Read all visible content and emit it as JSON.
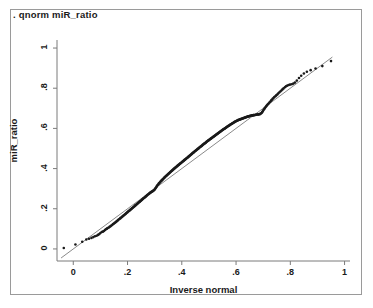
{
  "window": {
    "title": "qnorm miR_ratio plot",
    "background_color": "#ffffff",
    "frame_color": "#9a9a9a"
  },
  "command": {
    "text": ". qnorm miR_ratio"
  },
  "chart_data": {
    "type": "scatter",
    "title": ". qnorm miR_ratio",
    "xlabel": "Inverse normal",
    "ylabel": "miR_ratio",
    "xlim": [
      -0.06,
      1.02
    ],
    "ylim": [
      -0.06,
      1.04
    ],
    "xticks": [
      0,
      0.2,
      0.4,
      0.6,
      0.8,
      1
    ],
    "xtick_labels": [
      "0",
      ".2",
      ".4",
      ".6",
      ".8",
      "1"
    ],
    "yticks": [
      0,
      0.2,
      0.4,
      0.6,
      0.8,
      1
    ],
    "ytick_labels": [
      "0",
      ".2",
      ".4",
      ".6",
      ".8",
      "1"
    ],
    "grid": false,
    "legend": false,
    "point_color": "#1a1a1a",
    "point_size": 2.6,
    "reference_line": {
      "label": "45-degree reference line",
      "color": "#8a8a8a",
      "width": 1,
      "x_start": -0.045,
      "y_start": -0.045,
      "x_end": 0.955,
      "y_end": 0.955
    },
    "x": [
      -0.035,
      0.008,
      0.033,
      0.048,
      0.058,
      0.067,
      0.074,
      0.08,
      0.086,
      0.091,
      0.096,
      0.1,
      0.105,
      0.109,
      0.113,
      0.117,
      0.12,
      0.124,
      0.127,
      0.131,
      0.134,
      0.137,
      0.14,
      0.144,
      0.147,
      0.15,
      0.153,
      0.156,
      0.159,
      0.161,
      0.164,
      0.167,
      0.17,
      0.173,
      0.175,
      0.178,
      0.181,
      0.183,
      0.186,
      0.189,
      0.191,
      0.194,
      0.196,
      0.199,
      0.201,
      0.204,
      0.206,
      0.209,
      0.211,
      0.214,
      0.216,
      0.218,
      0.221,
      0.223,
      0.226,
      0.228,
      0.23,
      0.233,
      0.235,
      0.237,
      0.239,
      0.242,
      0.244,
      0.246,
      0.248,
      0.251,
      0.253,
      0.255,
      0.257,
      0.259,
      0.262,
      0.264,
      0.266,
      0.268,
      0.27,
      0.272,
      0.274,
      0.277,
      0.279,
      0.281,
      0.283,
      0.285,
      0.287,
      0.289,
      0.291,
      0.293,
      0.295,
      0.297,
      0.299,
      0.301,
      0.303,
      0.305,
      0.307,
      0.309,
      0.311,
      0.313,
      0.315,
      0.317,
      0.319,
      0.321,
      0.323,
      0.325,
      0.327,
      0.329,
      0.331,
      0.333,
      0.335,
      0.337,
      0.339,
      0.341,
      0.343,
      0.345,
      0.347,
      0.349,
      0.351,
      0.353,
      0.355,
      0.357,
      0.359,
      0.361,
      0.363,
      0.365,
      0.367,
      0.369,
      0.371,
      0.373,
      0.375,
      0.377,
      0.379,
      0.381,
      0.383,
      0.385,
      0.387,
      0.389,
      0.391,
      0.393,
      0.395,
      0.397,
      0.399,
      0.401,
      0.403,
      0.405,
      0.407,
      0.409,
      0.411,
      0.413,
      0.415,
      0.417,
      0.419,
      0.421,
      0.423,
      0.425,
      0.427,
      0.429,
      0.431,
      0.433,
      0.435,
      0.437,
      0.439,
      0.441,
      0.443,
      0.445,
      0.447,
      0.449,
      0.451,
      0.453,
      0.455,
      0.457,
      0.459,
      0.461,
      0.463,
      0.465,
      0.467,
      0.469,
      0.471,
      0.473,
      0.475,
      0.477,
      0.479,
      0.481,
      0.483,
      0.485,
      0.487,
      0.489,
      0.491,
      0.493,
      0.495,
      0.497,
      0.499,
      0.501,
      0.503,
      0.505,
      0.507,
      0.509,
      0.511,
      0.513,
      0.515,
      0.517,
      0.519,
      0.521,
      0.523,
      0.525,
      0.527,
      0.529,
      0.531,
      0.533,
      0.535,
      0.537,
      0.539,
      0.541,
      0.543,
      0.545,
      0.547,
      0.549,
      0.551,
      0.553,
      0.555,
      0.557,
      0.559,
      0.561,
      0.563,
      0.565,
      0.567,
      0.569,
      0.571,
      0.573,
      0.575,
      0.577,
      0.579,
      0.581,
      0.583,
      0.585,
      0.587,
      0.589,
      0.591,
      0.593,
      0.595,
      0.597,
      0.599,
      0.601,
      0.603,
      0.605,
      0.607,
      0.609,
      0.611,
      0.613,
      0.615,
      0.617,
      0.619,
      0.621,
      0.623,
      0.625,
      0.627,
      0.629,
      0.631,
      0.633,
      0.635,
      0.637,
      0.639,
      0.641,
      0.643,
      0.645,
      0.647,
      0.649,
      0.651,
      0.653,
      0.656,
      0.658,
      0.66,
      0.662,
      0.664,
      0.666,
      0.668,
      0.671,
      0.673,
      0.675,
      0.677,
      0.68,
      0.682,
      0.684,
      0.687,
      0.689,
      0.691,
      0.694,
      0.696,
      0.699,
      0.701,
      0.704,
      0.706,
      0.709,
      0.712,
      0.714,
      0.717,
      0.72,
      0.723,
      0.726,
      0.729,
      0.732,
      0.735,
      0.738,
      0.741,
      0.745,
      0.748,
      0.752,
      0.755,
      0.759,
      0.763,
      0.767,
      0.771,
      0.775,
      0.78,
      0.784,
      0.789,
      0.794,
      0.799,
      0.805,
      0.811,
      0.817,
      0.824,
      0.832,
      0.84,
      0.85,
      0.861,
      0.875,
      0.893,
      0.918,
      0.95
    ],
    "y": [
      0.005,
      0.022,
      0.036,
      0.047,
      0.051,
      0.055,
      0.059,
      0.063,
      0.066,
      0.07,
      0.074,
      0.079,
      0.084,
      0.086,
      0.089,
      0.094,
      0.098,
      0.101,
      0.104,
      0.107,
      0.11,
      0.113,
      0.117,
      0.12,
      0.124,
      0.127,
      0.13,
      0.133,
      0.136,
      0.139,
      0.142,
      0.146,
      0.149,
      0.152,
      0.155,
      0.158,
      0.161,
      0.164,
      0.167,
      0.17,
      0.173,
      0.176,
      0.179,
      0.182,
      0.185,
      0.188,
      0.19,
      0.193,
      0.196,
      0.199,
      0.202,
      0.204,
      0.207,
      0.21,
      0.213,
      0.216,
      0.218,
      0.221,
      0.224,
      0.226,
      0.229,
      0.232,
      0.234,
      0.237,
      0.239,
      0.242,
      0.245,
      0.247,
      0.25,
      0.252,
      0.255,
      0.257,
      0.26,
      0.262,
      0.265,
      0.267,
      0.27,
      0.272,
      0.275,
      0.277,
      0.279,
      0.281,
      0.283,
      0.285,
      0.286,
      0.288,
      0.29,
      0.292,
      0.295,
      0.298,
      0.302,
      0.306,
      0.31,
      0.314,
      0.318,
      0.321,
      0.325,
      0.328,
      0.331,
      0.334,
      0.337,
      0.34,
      0.343,
      0.345,
      0.348,
      0.351,
      0.354,
      0.356,
      0.359,
      0.362,
      0.364,
      0.367,
      0.369,
      0.372,
      0.374,
      0.377,
      0.379,
      0.382,
      0.384,
      0.387,
      0.389,
      0.391,
      0.394,
      0.396,
      0.399,
      0.401,
      0.403,
      0.406,
      0.408,
      0.41,
      0.412,
      0.415,
      0.417,
      0.419,
      0.421,
      0.424,
      0.426,
      0.428,
      0.43,
      0.433,
      0.435,
      0.437,
      0.439,
      0.442,
      0.444,
      0.446,
      0.448,
      0.451,
      0.453,
      0.455,
      0.457,
      0.46,
      0.462,
      0.464,
      0.466,
      0.469,
      0.471,
      0.473,
      0.476,
      0.478,
      0.48,
      0.482,
      0.485,
      0.487,
      0.489,
      0.491,
      0.494,
      0.496,
      0.498,
      0.5,
      0.502,
      0.505,
      0.507,
      0.509,
      0.511,
      0.513,
      0.515,
      0.518,
      0.52,
      0.522,
      0.524,
      0.526,
      0.528,
      0.53,
      0.533,
      0.535,
      0.537,
      0.539,
      0.541,
      0.543,
      0.545,
      0.547,
      0.549,
      0.551,
      0.553,
      0.555,
      0.557,
      0.559,
      0.561,
      0.563,
      0.565,
      0.567,
      0.569,
      0.571,
      0.573,
      0.575,
      0.577,
      0.579,
      0.581,
      0.583,
      0.585,
      0.587,
      0.589,
      0.591,
      0.593,
      0.595,
      0.597,
      0.598,
      0.6,
      0.602,
      0.604,
      0.606,
      0.608,
      0.61,
      0.612,
      0.613,
      0.615,
      0.617,
      0.619,
      0.621,
      0.622,
      0.624,
      0.626,
      0.627,
      0.629,
      0.631,
      0.632,
      0.634,
      0.635,
      0.637,
      0.638,
      0.639,
      0.641,
      0.642,
      0.643,
      0.644,
      0.645,
      0.646,
      0.647,
      0.648,
      0.649,
      0.65,
      0.651,
      0.652,
      0.653,
      0.654,
      0.655,
      0.656,
      0.657,
      0.658,
      0.659,
      0.66,
      0.66,
      0.661,
      0.662,
      0.663,
      0.664,
      0.664,
      0.665,
      0.665,
      0.666,
      0.666,
      0.667,
      0.667,
      0.668,
      0.668,
      0.669,
      0.669,
      0.67,
      0.67,
      0.671,
      0.672,
      0.674,
      0.677,
      0.681,
      0.686,
      0.691,
      0.696,
      0.701,
      0.706,
      0.711,
      0.715,
      0.72,
      0.724,
      0.729,
      0.733,
      0.738,
      0.742,
      0.747,
      0.751,
      0.756,
      0.76,
      0.765,
      0.769,
      0.774,
      0.779,
      0.784,
      0.789,
      0.794,
      0.799,
      0.805,
      0.81,
      0.813,
      0.816,
      0.818,
      0.82,
      0.823,
      0.828,
      0.838,
      0.851,
      0.862,
      0.873,
      0.882,
      0.89,
      0.898,
      0.91,
      0.935
    ]
  }
}
